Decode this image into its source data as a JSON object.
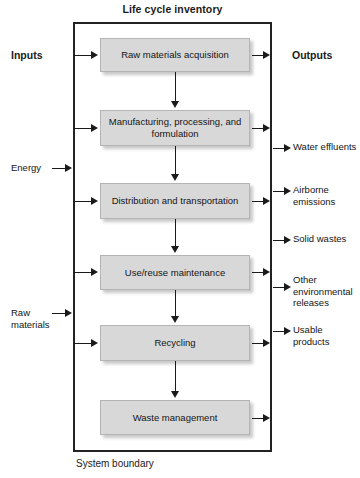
{
  "diagram": {
    "type": "flowchart",
    "title": "Life cycle inventory",
    "boundary_caption": "System boundary",
    "inputs_header": "Inputs",
    "outputs_header": "Outputs",
    "box_fill_color": "#d8d8d8",
    "line_color": "#1a1a1a"
  },
  "stages": [
    {
      "label": "Raw materials acquisition"
    },
    {
      "label": "Manufacturing, processing, and formulation"
    },
    {
      "label": "Distribution and transportation"
    },
    {
      "label": "Use/reuse maintenance"
    },
    {
      "label": "Recycling"
    },
    {
      "label": "Waste management"
    }
  ],
  "inputs": [
    {
      "label": "Energy"
    },
    {
      "label": "Raw materials"
    }
  ],
  "outputs": [
    {
      "label": "Water effluents"
    },
    {
      "label": "Airborne emissions"
    },
    {
      "label": "Solid wastes"
    },
    {
      "label": "Other environmental releases"
    },
    {
      "label": "Usable products"
    }
  ]
}
